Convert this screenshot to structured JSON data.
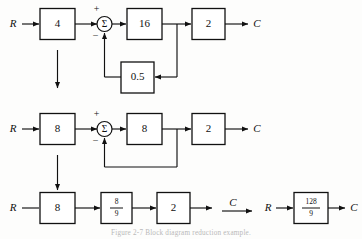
{
  "figure": {
    "caption": "Figure  2-7   Block diagram reduction example.",
    "ink_color": "#111111",
    "background_color": "#fdfdfc"
  },
  "rows": {
    "row1": {
      "name": "original-block-diagram",
      "input_label": "R",
      "output_label": "C",
      "sum_symbol": "Σ",
      "plus_sign": "+",
      "minus_sign": "−",
      "blocks": [
        {
          "id": "r1-gain-4",
          "label": "4"
        },
        {
          "id": "r1-gain-16",
          "label": "16"
        },
        {
          "id": "r1-gain-2",
          "label": "2"
        },
        {
          "id": "r1-feedback",
          "label": "0.5"
        }
      ]
    },
    "row2": {
      "name": "first-reduction-block-diagram",
      "input_label": "R",
      "output_label": "C",
      "sum_symbol": "Σ",
      "plus_sign": "+",
      "minus_sign": "−",
      "blocks": [
        {
          "id": "r2-gain-8a",
          "label": "8"
        },
        {
          "id": "r2-gain-8b",
          "label": "8"
        },
        {
          "id": "r2-gain-2",
          "label": "2"
        }
      ]
    },
    "row3": {
      "name": "second-reduction-block-diagram",
      "input_label": "R",
      "output_label": "C",
      "blocks": [
        {
          "id": "r3-gain-8",
          "label": "8"
        },
        {
          "id": "r3-gain-89",
          "numerator": "8",
          "denominator": "9"
        },
        {
          "id": "r3-gain-2",
          "label": "2"
        }
      ]
    },
    "row4": {
      "name": "final-reduced-block-diagram",
      "input_label": "R",
      "output_label": "C",
      "blocks": [
        {
          "id": "r4-gain-128-9",
          "numerator": "128",
          "denominator": "9"
        }
      ]
    }
  }
}
